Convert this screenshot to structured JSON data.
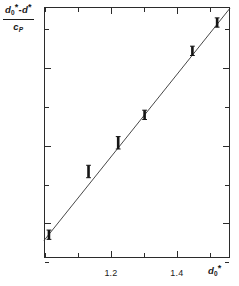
{
  "figure": {
    "background": "#ffffff",
    "ink": "#1a1a1a"
  },
  "axis_titles": {
    "y_numerator_d0": "d",
    "y_numerator_sub0": "0",
    "y_numerator_star1": "*",
    "y_numerator_minus": "-d",
    "y_numerator_star2": "*",
    "y_denominator_c": "c",
    "y_denominator_sub": "P",
    "x_title_d": "d",
    "x_title_sub": "0",
    "x_title_star": "*"
  },
  "chart_data": {
    "type": "scatter",
    "title": "",
    "xlabel": "d0*",
    "ylabel": "(d0* - d*) / cP",
    "xlim": [
      1.0,
      1.564
    ],
    "ylim": [
      -0.092,
      0.555
    ],
    "grid": false,
    "legend": null,
    "xticks": [
      1.0,
      1.1,
      1.2,
      1.3,
      1.4,
      1.5
    ],
    "xticklabels": [
      "",
      "",
      "1.2",
      "",
      "1.4",
      ""
    ],
    "yticks": [
      -0.1,
      0.0,
      0.1,
      0.2,
      0.3,
      0.4,
      0.5
    ],
    "yticklabels": [
      "",
      "0",
      "",
      "0.2",
      "",
      "0.4",
      ""
    ],
    "series": [
      {
        "name": "measured points",
        "marker": "square with vertical error bar",
        "x": [
          1.015,
          1.135,
          1.225,
          1.305,
          1.45,
          1.525
        ],
        "y": [
          -0.032,
          0.131,
          0.205,
          0.277,
          0.442,
          0.515
        ],
        "yerr": [
          0.012,
          0.016,
          0.016,
          0.012,
          0.012,
          0.012
        ]
      },
      {
        "name": "fitted straight line",
        "type": "line",
        "x": [
          1.0,
          1.564
        ],
        "y": [
          -0.047,
          0.552
        ]
      }
    ]
  }
}
